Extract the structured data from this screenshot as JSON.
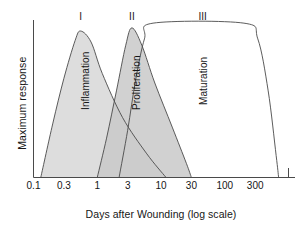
{
  "figure": {
    "axes": {
      "y_title": "Maximum response",
      "x_title": "Days after Wounding (log scale)"
    }
  },
  "chart_data": {
    "type": "area",
    "title": "",
    "subtitle": "",
    "xlabel": "Days after Wounding (log scale)",
    "ylabel": "Maximum response",
    "xscale": "log",
    "grid": false,
    "legend": "none",
    "x_tick_labels": [
      "0.1",
      "0.3",
      "1",
      "3",
      "10",
      "30",
      "100",
      "300"
    ],
    "x_tick_values": [
      0.1,
      0.3,
      1,
      3,
      10,
      30,
      100,
      300
    ],
    "xlim": [
      0.1,
      1000
    ],
    "ylim": [
      0,
      1
    ],
    "y_ticks": [],
    "annotations": [
      {
        "text": "I",
        "role": "phase-numeral",
        "phase": 1,
        "x_days": 0.55
      },
      {
        "text": "II",
        "role": "phase-numeral",
        "phase": 2,
        "x_days": 3.5
      },
      {
        "text": "III",
        "role": "phase-numeral",
        "phase": 3,
        "x_days": 45
      }
    ],
    "series": [
      {
        "name": "Inflammation",
        "label": "Inflammation",
        "fill": "#dddddd",
        "stroke": "#4a4a4a",
        "peak_x_days": 0.55,
        "peak_y": 0.93,
        "start_x_days": 0.13,
        "end_x_days": 12,
        "points": [
          {
            "x": 0.13,
            "y": 0.0
          },
          {
            "x": 0.2,
            "y": 0.34
          },
          {
            "x": 0.3,
            "y": 0.63
          },
          {
            "x": 0.45,
            "y": 0.87
          },
          {
            "x": 0.55,
            "y": 0.93
          },
          {
            "x": 0.8,
            "y": 0.86
          },
          {
            "x": 1.2,
            "y": 0.66
          },
          {
            "x": 2.5,
            "y": 0.38
          },
          {
            "x": 6,
            "y": 0.15
          },
          {
            "x": 12,
            "y": 0.0
          }
        ]
      },
      {
        "name": "Proliferation",
        "label": "Proliferation",
        "fill": "#c9c9c9",
        "stroke": "#4a4a4a",
        "peak_x_days": 3.5,
        "peak_y": 0.95,
        "start_x_days": 1.0,
        "end_x_days": 30,
        "points": [
          {
            "x": 1.0,
            "y": 0.0
          },
          {
            "x": 1.4,
            "y": 0.25
          },
          {
            "x": 2.0,
            "y": 0.55
          },
          {
            "x": 2.8,
            "y": 0.84
          },
          {
            "x": 3.5,
            "y": 0.95
          },
          {
            "x": 5,
            "y": 0.84
          },
          {
            "x": 8,
            "y": 0.6
          },
          {
            "x": 15,
            "y": 0.32
          },
          {
            "x": 25,
            "y": 0.09
          },
          {
            "x": 30,
            "y": 0.0
          }
        ]
      },
      {
        "name": "Maturation",
        "label": "Maturation",
        "fill": "none",
        "stroke": "#4a4a4a",
        "plateau_y": 0.98,
        "start_x_days": 2.2,
        "end_x_days": 700,
        "points": [
          {
            "x": 2.2,
            "y": 0.0
          },
          {
            "x": 3.0,
            "y": 0.3
          },
          {
            "x": 4.0,
            "y": 0.62
          },
          {
            "x": 5.5,
            "y": 0.88
          },
          {
            "x": 7.5,
            "y": 0.98
          },
          {
            "x": 200,
            "y": 0.98
          },
          {
            "x": 330,
            "y": 0.88
          },
          {
            "x": 480,
            "y": 0.55
          },
          {
            "x": 640,
            "y": 0.14
          },
          {
            "x": 700,
            "y": 0.0
          }
        ]
      }
    ]
  }
}
